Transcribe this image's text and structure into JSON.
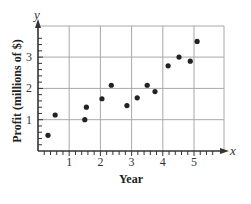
{
  "chart_data": {
    "type": "scatter",
    "title": "",
    "xlabel": "Year",
    "ylabel": "Profit (millions of $)",
    "x_axis_var": "x",
    "y_axis_var": "y",
    "xlim": [
      0,
      5.8
    ],
    "ylim": [
      0,
      3.8
    ],
    "x_ticks": [
      1,
      2,
      3,
      4,
      5
    ],
    "y_ticks": [
      1,
      2,
      3
    ],
    "x_minor_step": 0.2,
    "y_minor_step": 0.2,
    "grid": true,
    "legend": null,
    "series": [
      {
        "name": "Profit",
        "color": "#222222",
        "points": [
          {
            "x": 0.32,
            "y": 0.5
          },
          {
            "x": 0.55,
            "y": 1.15
          },
          {
            "x": 1.5,
            "y": 1.0
          },
          {
            "x": 1.55,
            "y": 1.4
          },
          {
            "x": 2.05,
            "y": 1.67
          },
          {
            "x": 2.35,
            "y": 2.1
          },
          {
            "x": 2.85,
            "y": 1.45
          },
          {
            "x": 3.18,
            "y": 1.7
          },
          {
            "x": 3.5,
            "y": 2.1
          },
          {
            "x": 3.75,
            "y": 1.9
          },
          {
            "x": 4.17,
            "y": 2.72
          },
          {
            "x": 4.52,
            "y": 3.0
          },
          {
            "x": 4.88,
            "y": 2.87
          },
          {
            "x": 5.1,
            "y": 3.5
          }
        ]
      }
    ]
  },
  "colors": {
    "axis": "#333333",
    "grid": "#a8a8a8",
    "point": "#222222"
  }
}
